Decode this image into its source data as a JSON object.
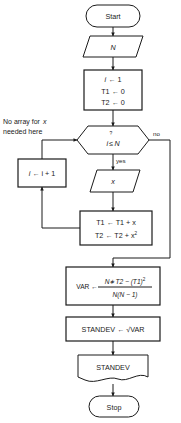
{
  "diagram": {
    "annotation": {
      "line1": "No array for",
      "line1_italic": "x",
      "line2": "needed here"
    },
    "nodes": {
      "start": {
        "label": "Start",
        "shape": "terminator"
      },
      "input_n": {
        "label": "N",
        "shape": "parallelogram"
      },
      "init": {
        "shape": "process",
        "line1_var": "i",
        "line1_rest": "← 1",
        "line2": "T1 ← 0",
        "line3": "T2 ← 0"
      },
      "decision": {
        "shape": "hexagon",
        "question_mark": "?",
        "var": "i",
        "op": "≤",
        "bound": "N"
      },
      "increment": {
        "shape": "process",
        "text_var": "i",
        "text_rest": "← i + 1"
      },
      "input_x": {
        "label": "x",
        "shape": "parallelogram"
      },
      "accumulate": {
        "shape": "process",
        "line1": "T1 ← T1 + x",
        "line2_base": "T2 ← T2 + x",
        "line2_exp": "2"
      },
      "variance": {
        "shape": "process",
        "assign": "VAR ←",
        "numerator_a": "N∗T2 − (T1)",
        "numerator_exp": "2",
        "denominator": "N(N − 1)"
      },
      "standev": {
        "shape": "process",
        "text": "STANDEV ← √VAR"
      },
      "output": {
        "label": "STANDEV",
        "shape": "document"
      },
      "stop": {
        "label": "Stop",
        "shape": "terminator"
      }
    },
    "edges": {
      "yes_label": "yes",
      "no_label": "no"
    },
    "colors": {
      "stroke": "#1a1a1a",
      "fill": "#ffffff",
      "background": "#ffffff"
    }
  }
}
